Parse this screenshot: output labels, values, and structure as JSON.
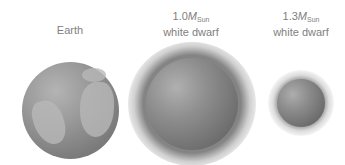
{
  "figure": {
    "objects": [
      {
        "id": "earth",
        "label_line1": "Earth",
        "label_line2": ""
      },
      {
        "id": "wd1",
        "mass_value": "1.0",
        "mass_symbol": "M",
        "mass_subscript": "Sun",
        "label_line2": "white dwarf"
      },
      {
        "id": "wd2",
        "mass_value": "1.3",
        "mass_symbol": "M",
        "mass_subscript": "Sun",
        "label_line2": "white dwarf"
      }
    ],
    "colors": {
      "background": "#ffffff",
      "label": "#808080",
      "sphere_mid": "#8e8e8e",
      "sphere_dark": "#5c5c5c"
    }
  }
}
